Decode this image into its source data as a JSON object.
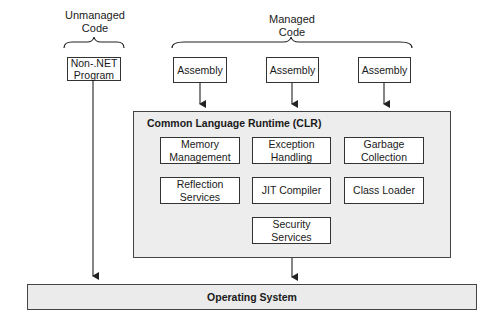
{
  "labels": {
    "unmanaged": [
      "Unmanaged",
      "Code"
    ],
    "managed": [
      "Managed",
      "Code"
    ]
  },
  "non_net_program": [
    "Non-.NET",
    "Program"
  ],
  "assemblies": [
    "Assembly",
    "Assembly",
    "Assembly"
  ],
  "clr": {
    "title": "Common Language Runtime (CLR)",
    "components": [
      [
        "Memory",
        "Management"
      ],
      [
        "Exception",
        "Handling"
      ],
      [
        "Garbage",
        "Collection"
      ],
      [
        "Reflection",
        "Services"
      ],
      [
        "JIT Compiler"
      ],
      [
        "Class Loader"
      ],
      [
        "Security",
        "Services"
      ]
    ]
  },
  "operating_system": "Operating System"
}
